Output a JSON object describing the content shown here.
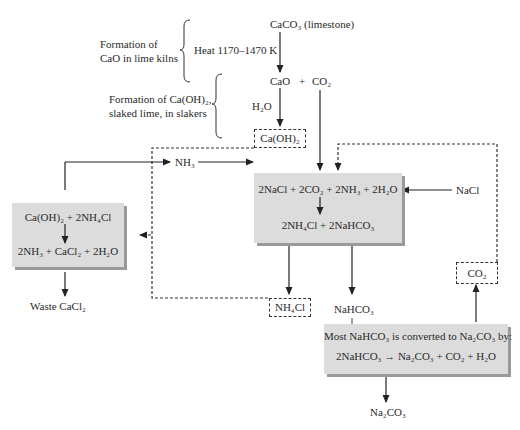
{
  "diagram": {
    "top": {
      "caco3": "CaCO₃ (limestone)",
      "heat": "Heat 1170–1470 K",
      "cao": "CaO",
      "plus": "+",
      "co2": "CO₂",
      "h2o": "H₂O",
      "caoh2": "Ca(OH)₂"
    },
    "annotations": {
      "cao_formation_line1": "Formation of",
      "cao_formation_line2": "CaO in lime kilns",
      "caoh2_formation_line1": "Formation of Ca(OH)₂,",
      "caoh2_formation_line2": "slaked lime, in slakers"
    },
    "left_box": {
      "reactants": "Ca(OH)₂ + 2NH₄Cl",
      "products": "2NH₃ + CaCl₂ + 2H₂O"
    },
    "waste": "Waste CaCl₂",
    "nh3": "NH₃",
    "center_box": {
      "reactants": "2NaCl + 2CO₂ + 2NH₃ + 2H₂O",
      "products": "2NH₄Cl + 2NaHCO₃"
    },
    "nacl": "NaCl",
    "nh4cl": "NH₄Cl",
    "nahco3": "NaHCO₃",
    "co2_recycle": "CO₂",
    "bottom_box": {
      "line1": "Most NaHCO₃ is converted to Na₂CO₃ by:",
      "line2": "2NaHCO₃ → Na₂CO₃ + CO₂ + H₂O"
    },
    "na2co3": "Na₂CO₃"
  }
}
